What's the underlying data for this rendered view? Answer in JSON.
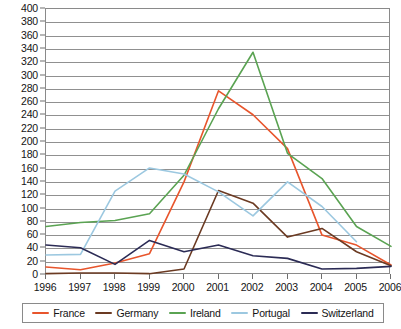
{
  "chart_data": {
    "type": "line",
    "title": "",
    "xlabel": "",
    "ylabel": "",
    "grid": true,
    "legend_position": "bottom",
    "categories": [
      "1996",
      "1997",
      "1998",
      "1999",
      "2000",
      "2001",
      "2002",
      "2003",
      "2004",
      "2005",
      "2006"
    ],
    "ylim": [
      0,
      400
    ],
    "ytick_step": 20,
    "yticks": [
      "400",
      "380",
      "360",
      "340",
      "320",
      "300",
      "280",
      "260",
      "240",
      "220",
      "200",
      "180",
      "160",
      "140",
      "120",
      "100",
      "80",
      "60",
      "40",
      "20",
      "0"
    ],
    "series": [
      {
        "name": "France",
        "color": "#e8552c",
        "values": [
          12,
          8,
          18,
          32,
          140,
          277,
          241,
          190,
          60,
          45,
          15
        ]
      },
      {
        "name": "Germany",
        "color": "#6b3a22",
        "values": [
          2,
          3,
          3,
          2,
          9,
          127,
          108,
          57,
          70,
          35,
          14
        ]
      },
      {
        "name": "Ireland",
        "color": "#5aa352",
        "values": [
          73,
          79,
          82,
          92,
          150,
          250,
          335,
          183,
          145,
          73,
          43
        ]
      },
      {
        "name": "Portugal",
        "color": "#9cc8e0",
        "values": [
          30,
          31,
          126,
          161,
          152,
          125,
          89,
          140,
          103,
          50,
          null
        ]
      },
      {
        "name": "Switzerland",
        "color": "#2b2b55",
        "values": [
          45,
          41,
          16,
          52,
          35,
          45,
          29,
          25,
          9,
          10,
          13
        ]
      }
    ]
  },
  "legend": {
    "items": [
      {
        "label": "France"
      },
      {
        "label": "Germany"
      },
      {
        "label": "Ireland"
      },
      {
        "label": "Portugal"
      },
      {
        "label": "Switzerland"
      }
    ]
  }
}
